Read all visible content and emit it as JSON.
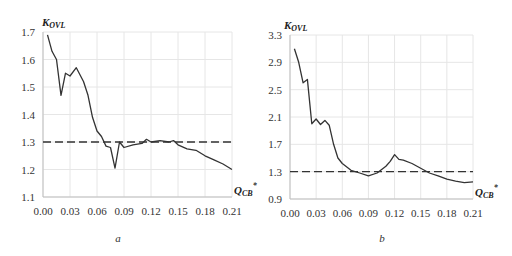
{
  "chart_data": [
    {
      "type": "line",
      "panel": "a",
      "caption": "a",
      "ylabel": "K",
      "ylabel_sub": "OVL",
      "xlabel": "Q",
      "xlabel_sub": "CB",
      "xlabel_sup": "*",
      "ylim": [
        1.1,
        1.7
      ],
      "xlim": [
        0.0,
        0.21
      ],
      "yticks": [
        "1.1",
        "1.2",
        "1.3",
        "1.4",
        "1.5",
        "1.6",
        "1.7"
      ],
      "xticks": [
        "0.00",
        "0.03",
        "0.06",
        "0.09",
        "0.12",
        "0.15",
        "0.18",
        "0.21"
      ],
      "grid": true,
      "series": [
        {
          "name": "K_OVL",
          "style": "solid",
          "x": [
            0.005,
            0.01,
            0.015,
            0.02,
            0.025,
            0.03,
            0.037,
            0.045,
            0.05,
            0.055,
            0.06,
            0.065,
            0.07,
            0.075,
            0.08,
            0.085,
            0.09,
            0.1,
            0.11,
            0.115,
            0.12,
            0.13,
            0.14,
            0.145,
            0.15,
            0.16,
            0.17,
            0.18,
            0.19,
            0.2,
            0.21
          ],
          "y": [
            1.69,
            1.63,
            1.6,
            1.47,
            1.55,
            1.54,
            1.57,
            1.52,
            1.47,
            1.39,
            1.34,
            1.32,
            1.285,
            1.28,
            1.205,
            1.3,
            1.28,
            1.29,
            1.295,
            1.31,
            1.3,
            1.305,
            1.3,
            1.305,
            1.29,
            1.275,
            1.27,
            1.25,
            1.235,
            1.22,
            1.2
          ]
        },
        {
          "name": "threshold",
          "style": "dashed",
          "x": [
            0.0,
            0.21
          ],
          "y": [
            1.3,
            1.3
          ]
        }
      ]
    },
    {
      "type": "line",
      "panel": "b",
      "caption": "b",
      "ylabel": "K",
      "ylabel_sub": "OVL",
      "xlabel": "Q",
      "xlabel_sub": "CB",
      "xlabel_sup": "*",
      "ylim": [
        0.9,
        3.3
      ],
      "xlim": [
        0.0,
        0.21
      ],
      "yticks": [
        "0.9",
        "1.3",
        "1.7",
        "2.1",
        "2.5",
        "2.9",
        "3.3"
      ],
      "xticks": [
        "0.00",
        "0.03",
        "0.06",
        "0.09",
        "0.12",
        "0.15",
        "0.18",
        "0.21"
      ],
      "grid": true,
      "series": [
        {
          "name": "K_OVL",
          "style": "solid",
          "x": [
            0.005,
            0.01,
            0.015,
            0.02,
            0.025,
            0.03,
            0.035,
            0.04,
            0.045,
            0.05,
            0.055,
            0.06,
            0.07,
            0.08,
            0.09,
            0.1,
            0.11,
            0.115,
            0.12,
            0.125,
            0.13,
            0.14,
            0.15,
            0.16,
            0.17,
            0.18,
            0.19,
            0.2,
            0.21
          ],
          "y": [
            3.1,
            2.9,
            2.6,
            2.65,
            2.0,
            2.07,
            1.99,
            2.05,
            1.98,
            1.7,
            1.5,
            1.42,
            1.32,
            1.28,
            1.24,
            1.28,
            1.38,
            1.45,
            1.55,
            1.48,
            1.47,
            1.42,
            1.35,
            1.28,
            1.24,
            1.19,
            1.16,
            1.14,
            1.15
          ]
        },
        {
          "name": "threshold",
          "style": "dashed",
          "x": [
            0.0,
            0.21
          ],
          "y": [
            1.3,
            1.3
          ]
        }
      ]
    }
  ]
}
